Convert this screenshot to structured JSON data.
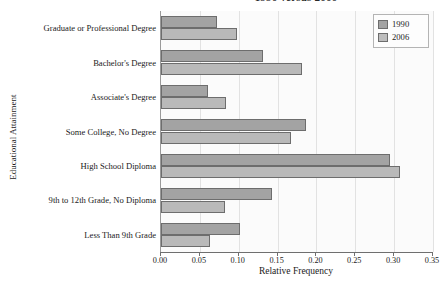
{
  "chart_data": {
    "type": "bar",
    "orientation": "horizontal",
    "title": "1990 versus 2006",
    "xlabel": "Relative Frequency",
    "ylabel": "Educational Attainment",
    "xlim": [
      0.0,
      0.35
    ],
    "xticks": [
      "0.00",
      "0.05",
      "0.10",
      "0.15",
      "0.20",
      "0.25",
      "0.30",
      "0.35"
    ],
    "xtick_values": [
      0.0,
      0.05,
      0.1,
      0.15,
      0.2,
      0.25,
      0.3,
      0.35
    ],
    "grid": true,
    "legend_position": "top-right",
    "categories": [
      "Graduate or Professional Degree",
      "Bachelor's Degree",
      "Associate's Degree",
      "Some College, No Degree",
      "High School Diploma",
      "9th to 12th Grade, No Diploma",
      "Less Than 9th Grade"
    ],
    "series": [
      {
        "name": "1990",
        "color": "#a3a3a3",
        "values": [
          0.072,
          0.131,
          0.06,
          0.186,
          0.295,
          0.143,
          0.102
        ]
      },
      {
        "name": "2006",
        "color": "#bdbdbd",
        "values": [
          0.098,
          0.182,
          0.083,
          0.167,
          0.308,
          0.082,
          0.063
        ]
      }
    ]
  },
  "legend": {
    "entries": [
      {
        "label": "1990"
      },
      {
        "label": "2006"
      }
    ]
  }
}
